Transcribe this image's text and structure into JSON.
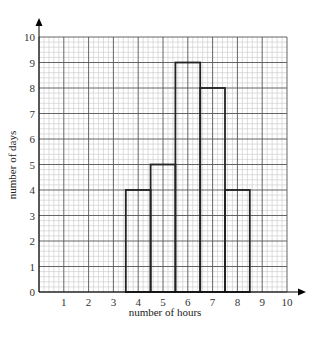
{
  "chart_data": {
    "type": "bar",
    "subtype": "histogram",
    "title": "",
    "xlabel": "number of hours",
    "ylabel": "number of days",
    "xlim": [
      0,
      10
    ],
    "ylim": [
      0,
      10
    ],
    "x_ticks": [
      "1",
      "2",
      "3",
      "4",
      "5",
      "6",
      "7",
      "8",
      "9",
      "10"
    ],
    "y_ticks": [
      "0",
      "1",
      "2",
      "3",
      "4",
      "5",
      "6",
      "7",
      "8",
      "9",
      "10"
    ],
    "grid": true,
    "grid_minor_divisions": 5,
    "categories": [
      "4",
      "5",
      "6",
      "7",
      "8"
    ],
    "bins": [
      {
        "x0": 3.5,
        "x1": 4.5,
        "value": 4
      },
      {
        "x0": 4.5,
        "x1": 5.5,
        "value": 5
      },
      {
        "x0": 5.5,
        "x1": 6.5,
        "value": 9
      },
      {
        "x0": 6.5,
        "x1": 7.5,
        "value": 8
      },
      {
        "x0": 7.5,
        "x1": 8.5,
        "value": 4
      }
    ],
    "values": [
      4,
      5,
      9,
      8,
      4
    ],
    "colors": {
      "minor_grid": "#c8c8c8",
      "major_grid": "#555555",
      "bar_stroke": "#222222",
      "axis": "#000000"
    }
  }
}
